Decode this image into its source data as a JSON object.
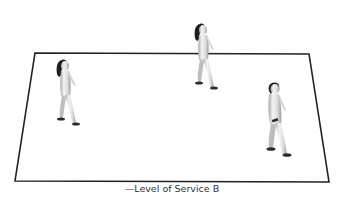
{
  "diagram": {
    "caption": "—Level of Service B",
    "plane": {
      "shape": "trapezoid",
      "stroke_color": "#222222",
      "fill_color": "#ffffff",
      "corners": {
        "top_left": [
          35,
          53
        ],
        "top_right": [
          309,
          54
        ],
        "bottom_right": [
          329,
          182
        ],
        "bottom_left": [
          15,
          181
        ]
      }
    },
    "pedestrians": [
      {
        "id": "pedestrian-left",
        "hair": "long",
        "direction": "right",
        "position": [
          68,
          100
        ]
      },
      {
        "id": "pedestrian-center",
        "hair": "long",
        "direction": "right",
        "position": [
          207,
          65
        ]
      },
      {
        "id": "pedestrian-right",
        "hair": "short",
        "direction": "right",
        "position": [
          280,
          125
        ]
      }
    ],
    "colors": {
      "figure_body": "#e8e8e8",
      "figure_shadow": "#9a9a9a",
      "figure_hair": "#1e1e1e",
      "figure_shoes": "#2a2a2a"
    }
  }
}
